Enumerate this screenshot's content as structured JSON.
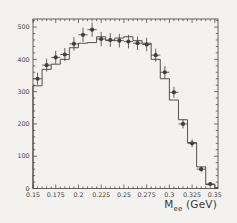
{
  "figure": {
    "background_color": "#f3f2ef",
    "ink_color": "#3f3f3f",
    "xlabel": {
      "main": "M",
      "sub": "ee",
      "unit": " (GeV)"
    }
  },
  "chart_data": {
    "type": "bar",
    "subtype": "step-histogram-with-scatter-points",
    "title": "",
    "xlabel": "M_ee (GeV)",
    "ylabel": "",
    "xlim": [
      0.15,
      0.3535
    ],
    "ylim": [
      0,
      525
    ],
    "grid": false,
    "legend": "none",
    "x_ticks_major": [
      0.15,
      0.175,
      0.2,
      0.225,
      0.25,
      0.275,
      0.3,
      0.325,
      0.35
    ],
    "x_tick_labels": [
      "0.15",
      "0.175",
      "0.2",
      "0.225",
      "0.25",
      "0.275",
      "0.3",
      "0.325",
      "0.35"
    ],
    "x_minor_step": 0.005,
    "y_ticks_major": [
      0,
      100,
      200,
      300,
      400,
      500
    ],
    "y_tick_labels": [
      "0",
      "100",
      "200",
      "300",
      "400",
      "500"
    ],
    "y_minor_step": 20,
    "histogram": {
      "name": "step-histogram-line",
      "bin_start": 0.15,
      "bin_width": 0.01,
      "values": [
        318,
        369,
        385,
        400,
        436,
        450,
        452,
        470,
        458,
        466,
        470,
        458,
        450,
        400,
        340,
        274,
        213,
        142,
        67,
        12
      ],
      "tail_value": 3
    },
    "points": {
      "name": "data-points-with-error-bars",
      "x": [
        0.155,
        0.165,
        0.175,
        0.185,
        0.195,
        0.205,
        0.215,
        0.225,
        0.235,
        0.245,
        0.255,
        0.265,
        0.275,
        0.285,
        0.295,
        0.305,
        0.315,
        0.325,
        0.335,
        0.345
      ],
      "y": [
        340,
        382,
        406,
        415,
        448,
        476,
        492,
        463,
        460,
        458,
        455,
        450,
        446,
        413,
        360,
        298,
        200,
        140,
        60,
        14
      ],
      "y_err": [
        19,
        20,
        20,
        20,
        21,
        22,
        22,
        22,
        21,
        21,
        21,
        21,
        21,
        20,
        19,
        17,
        14,
        12,
        8,
        5
      ],
      "x_err": 0.005
    }
  }
}
